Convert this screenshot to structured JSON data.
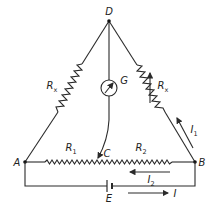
{
  "diagram": {
    "type": "bridge-circuit",
    "nodes": {
      "D": {
        "label": "D"
      },
      "A": {
        "label": "A"
      },
      "B": {
        "label": "B"
      },
      "C": {
        "label": "C"
      },
      "E": {
        "label": "E"
      }
    },
    "components": {
      "left_resistor": {
        "label": "R",
        "sub": "x"
      },
      "right_resistor": {
        "label": "R",
        "sub": "x",
        "variable": true
      },
      "galvanometer": {
        "label": "G"
      },
      "r1": {
        "label": "R",
        "sub": "1"
      },
      "r2": {
        "label": "R",
        "sub": "2"
      },
      "battery": {
        "label": "E"
      }
    },
    "currents": {
      "i1": {
        "label": "I",
        "sub": "1"
      },
      "i2": {
        "label": "I",
        "sub": "2"
      },
      "i": {
        "label": "I"
      }
    },
    "colors": {
      "line": "#2a2a2a",
      "background": "#ffffff"
    }
  }
}
